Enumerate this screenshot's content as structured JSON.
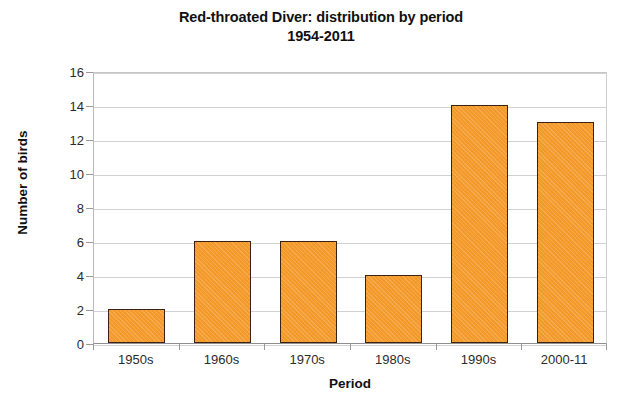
{
  "chart_data": {
    "type": "bar",
    "title": "Red-throated Diver: distribution by period 1954-2011",
    "title_line1": "Red-throated Diver: distribution by period",
    "title_line2": "1954-2011",
    "categories": [
      "1950s",
      "1960s",
      "1970s",
      "1980s",
      "1990s",
      "2000-11"
    ],
    "values": [
      2,
      6,
      6,
      4,
      14,
      13
    ],
    "xlabel": "Period",
    "ylabel": "Number of birds",
    "ylim": [
      0,
      16
    ],
    "ytick_step": 2,
    "yticks": [
      16,
      14,
      12,
      10,
      8,
      6,
      4,
      2,
      0
    ],
    "grid": true,
    "legend": null,
    "series": [
      {
        "name": "Number of birds",
        "values": [
          2,
          6,
          6,
          4,
          14,
          13
        ]
      }
    ],
    "colors": {
      "bar_fill": "#f59b2c",
      "bar_border": "#3d2111",
      "gridline": "#d2d2d2",
      "axis": "#909090",
      "text": "#101010",
      "background": "#ffffff"
    }
  }
}
